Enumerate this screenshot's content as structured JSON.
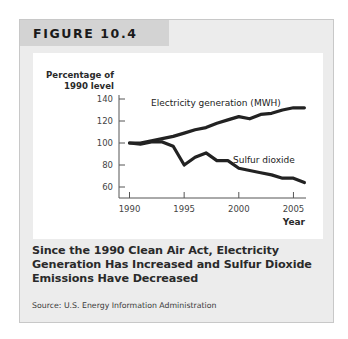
{
  "figure": {
    "label": "FIGURE 10.4",
    "caption": "Since the 1990 Clean Air Act, Electricity Generation Has Increased and Sulfur Dioxide Emissions Have Decreased",
    "source": "Source: U.S. Energy Information Administration"
  },
  "chart_data": {
    "type": "line",
    "title": "Since the 1990 Clean Air Act, Electricity Generation Has Increased and Sulfur Dioxide Emissions Have Decreased",
    "xlabel": "Year",
    "ylabel_line1": "Percentage of",
    "ylabel_line2": "1990 level",
    "x": [
      1990,
      1991,
      1992,
      1993,
      1994,
      1995,
      1996,
      1997,
      1998,
      1999,
      2000,
      2001,
      2002,
      2003,
      2004,
      2005,
      2006
    ],
    "series": [
      {
        "name": "Electricity generation (MWH)",
        "values": [
          100,
          100,
          102,
          104,
          106,
          109,
          112,
          114,
          118,
          121,
          124,
          122,
          126,
          127,
          130,
          132,
          132
        ]
      },
      {
        "name": "Sulfur dioxide",
        "values": [
          100,
          99,
          101,
          101,
          97,
          80,
          87,
          91,
          84,
          84,
          77,
          75,
          73,
          71,
          68,
          68,
          64
        ]
      }
    ],
    "xticks": [
      "1990",
      "1995",
      "2000",
      "2005"
    ],
    "yticks": [
      "60",
      "80",
      "100",
      "120",
      "140"
    ],
    "xlim": [
      1990,
      2006.5
    ],
    "ylim": [
      52,
      150
    ],
    "grid": false,
    "legend": "inline labels",
    "annotations": [
      "Electricity generation (MWH)",
      "Sulfur dioxide"
    ],
    "line_color": "#222222"
  }
}
